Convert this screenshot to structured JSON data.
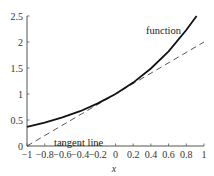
{
  "chart_data": {
    "type": "line",
    "title": "",
    "xlabel": "x",
    "ylabel": "",
    "xlim": [
      -1,
      1
    ],
    "ylim": [
      0,
      2.5
    ],
    "grid": false,
    "x_ticks": [
      -1,
      -0.8,
      -0.6,
      -0.4,
      -0.2,
      0,
      0.2,
      0.4,
      0.6,
      0.8,
      1
    ],
    "x_tick_labels": [
      "−1",
      "−0.8",
      "−0.6",
      "−0.4",
      "−0.2",
      "0",
      "0.2",
      "0.4",
      "0.6",
      "0.8",
      "1"
    ],
    "y_ticks": [
      0,
      0.5,
      1,
      1.5,
      2,
      2.5
    ],
    "y_tick_labels": [
      "0",
      "0.5",
      "1",
      "1.5",
      "2",
      "2.5"
    ],
    "series": [
      {
        "name": "function",
        "style": "solid",
        "color": "#111111",
        "x": [
          -1,
          -0.8,
          -0.6,
          -0.4,
          -0.2,
          0,
          0.2,
          0.4,
          0.6,
          0.8,
          0.916
        ],
        "y": [
          0.37,
          0.45,
          0.55,
          0.67,
          0.82,
          1.0,
          1.22,
          1.49,
          1.82,
          2.23,
          2.5
        ]
      },
      {
        "name": "tangent line",
        "style": "dashed",
        "color": "#333333",
        "x": [
          -1,
          1
        ],
        "y": [
          0,
          2
        ]
      }
    ],
    "annotations": [
      {
        "text": "function",
        "x": 0.55,
        "y": 2.22
      },
      {
        "text": "tangent line",
        "x": -0.62,
        "y": 0.1
      }
    ]
  },
  "labels": {
    "function": "function",
    "tangent": "tangent line",
    "xlabel": "x"
  }
}
